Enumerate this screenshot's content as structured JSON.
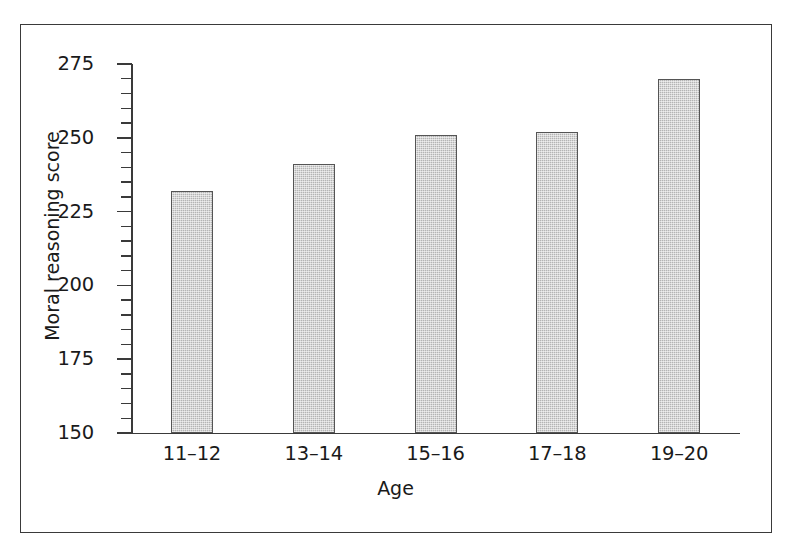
{
  "chart_data": {
    "type": "bar",
    "title": "",
    "subtitle": "",
    "xlabel": "Age",
    "ylabel": "Moral reasoning score",
    "categories": [
      "11–12",
      "13–14",
      "15–16",
      "17–18",
      "19–20"
    ],
    "values": [
      232,
      241,
      251,
      252,
      270
    ],
    "ylim": [
      150,
      275
    ],
    "ytick_labels": [
      "275",
      "250",
      "225",
      "200",
      "175",
      "150"
    ],
    "ytick_values": [
      275,
      250,
      225,
      200,
      175,
      150
    ],
    "ytick_minor_step": 5,
    "grid": false,
    "legend": null,
    "series": [
      {
        "name": "Moral reasoning score",
        "values": [
          232,
          241,
          251,
          252,
          270
        ]
      }
    ],
    "annotations": [],
    "colors": {
      "bar_fill": "#b4b4b4",
      "bar_edge": "#555555",
      "axis": "#3a3a3a",
      "text": "#1a1a1a",
      "frame": "#3a3a3a",
      "background": "#ffffff"
    }
  }
}
